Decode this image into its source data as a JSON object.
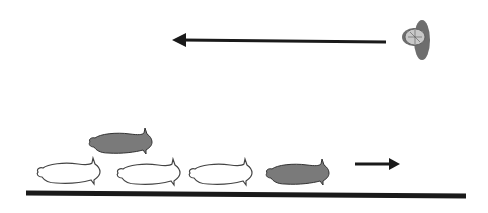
{
  "diagram": {
    "colors": {
      "background": "#ffffff",
      "ink": "#1a1a1a",
      "filled_larva": "#7a7a7a",
      "outline_larva": "#ffffff",
      "head_front": "#6e6e6e",
      "head_face": "#c8c8c8"
    },
    "elements": {
      "top_arrow": {
        "direction": "left"
      },
      "small_arrow": {
        "direction": "right"
      },
      "ground": {
        "type": "line"
      },
      "larvae_row": [
        {
          "style": "outline"
        },
        {
          "style": "outline"
        },
        {
          "style": "outline"
        },
        {
          "style": "filled"
        }
      ],
      "raised_larva": {
        "style": "filled"
      },
      "front_view": {
        "style": "head-on"
      }
    }
  }
}
